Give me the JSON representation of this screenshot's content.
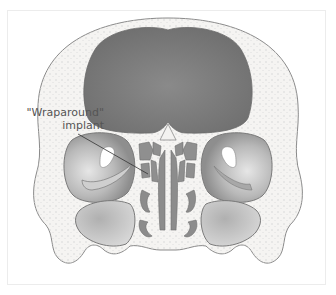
{
  "figure": {
    "annotation": {
      "line1": "\"Wraparound\"",
      "line2": "implant"
    },
    "colors": {
      "bone": "#f4f3f1",
      "outline": "#8a8a8a",
      "brain_cavity": "#7d7d7d",
      "orbit_dark": "#9a9a9a",
      "orbit_light": "#d8d8d8",
      "airway": "#8c8c8c",
      "background": "#ffffff"
    }
  }
}
